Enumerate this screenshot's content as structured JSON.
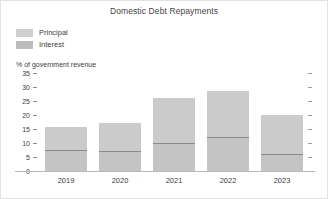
{
  "chart_data": {
    "type": "bar",
    "title": "Domestic Debt Repayments",
    "subtitle": "",
    "xlabel": "",
    "ylabel": "% of government revenue",
    "categories": [
      "2019",
      "2020",
      "2021",
      "2022",
      "2023"
    ],
    "series": [
      {
        "name": "Interest",
        "values": [
          7.5,
          7.0,
          10.0,
          12.0,
          6.0
        ],
        "color": "#c2c2c2"
      },
      {
        "name": "Principal",
        "values": [
          8.2,
          10.0,
          16.0,
          16.5,
          14.0
        ],
        "color": "#c9c9c9"
      }
    ],
    "totals": [
      15.7,
      17.0,
      26.0,
      28.5,
      20.0
    ],
    "stacked": true,
    "ylim": [
      0,
      35
    ],
    "ytick_values": [
      35,
      30,
      25,
      20,
      15,
      10,
      5,
      0
    ],
    "ytick_labels": [
      "35",
      "30",
      "25",
      "20",
      "15",
      "10",
      "5",
      "0"
    ],
    "grid": false,
    "legend_position": "top-left",
    "right_axis_ticks": true
  },
  "title": "Domestic Debt Repayments",
  "axis": {
    "y_caption": "% of government revenue"
  },
  "legend": {
    "items": [
      {
        "label": "Principal",
        "color": "#cfcfcf"
      },
      {
        "label": "Interest",
        "color": "#bcbcbc"
      }
    ]
  },
  "colors": {
    "principal": "#cbcbcb",
    "interest": "#c4c4c4",
    "divider": "#8b8b8b",
    "axis": "#b8b8b8",
    "text": "#3d3d3d",
    "border": "#e2e2e2"
  }
}
